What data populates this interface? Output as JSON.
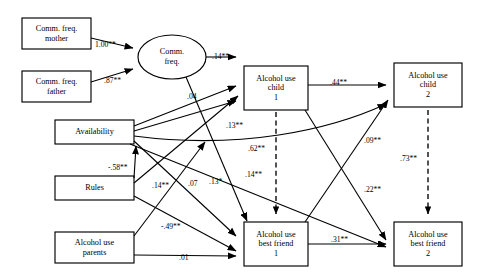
{
  "diagram": {
    "type": "structural-equation-model-path-diagram",
    "observed_variables": [
      {
        "id": "comm_mother",
        "label": "Comm. freq.\nmother",
        "x": 22,
        "y": 18,
        "w": 69,
        "h": 31
      },
      {
        "id": "comm_father",
        "label": "Comm. freq.\nfather",
        "x": 22,
        "y": 71,
        "w": 69,
        "h": 31
      },
      {
        "id": "availability",
        "label": "Availability",
        "x": 55,
        "y": 120,
        "w": 79,
        "h": 24
      },
      {
        "id": "rules",
        "label": "Rules",
        "x": 55,
        "y": 176,
        "w": 79,
        "h": 24
      },
      {
        "id": "alcohol_parents",
        "label": "Alcohol use\nparents",
        "x": 55,
        "y": 232,
        "w": 79,
        "h": 31
      },
      {
        "id": "alc_child_1",
        "label": "Alcohol use\nchild\n1",
        "x": 244,
        "y": 66,
        "w": 64,
        "h": 44
      },
      {
        "id": "alc_child_2",
        "label": "Alcohol use\nchild\n2",
        "x": 394,
        "y": 63,
        "w": 68,
        "h": 44
      },
      {
        "id": "alc_friend_1",
        "label": "Alcohol use\nbest friend\n1",
        "x": 244,
        "y": 222,
        "w": 64,
        "h": 44
      },
      {
        "id": "alc_friend_2",
        "label": "Alcohol use\nbest friend\n2",
        "x": 394,
        "y": 222,
        "w": 68,
        "h": 44
      }
    ],
    "latent_variables": [
      {
        "id": "comm_freq",
        "label": "Comm.\nfreq.",
        "cx": 172,
        "cy": 57,
        "rx": 34,
        "ry": 22
      }
    ],
    "paths": [
      {
        "id": "p1",
        "from": "comm_mother",
        "to": "comm_freq",
        "coefficient": "1.00**",
        "style": "solid"
      },
      {
        "id": "p2",
        "from": "comm_father",
        "to": "comm_freq",
        "coefficient": ".87**",
        "style": "solid"
      },
      {
        "id": "p3",
        "from": "comm_freq",
        "to": "alc_child_1",
        "coefficient": ".14**",
        "style": "solid"
      },
      {
        "id": "p4",
        "from": "comm_freq",
        "to": "alc_friend_1",
        "coefficient": "",
        "style": "solid"
      },
      {
        "id": "p5",
        "from": "availability",
        "to": "alc_child_1",
        "coefficient": ".04",
        "style": "solid"
      },
      {
        "id": "p6",
        "from": "availability",
        "to": "alc_child_1",
        "coefficient": ".13**",
        "style": "solid"
      },
      {
        "id": "p7",
        "from": "availability",
        "to": "alc_friend_1",
        "coefficient": ".14**",
        "style": "solid"
      },
      {
        "id": "p8",
        "from": "availability",
        "to": "alc_friend_2",
        "coefficient": ".22**",
        "style": "solid"
      },
      {
        "id": "p9",
        "from": "availability",
        "to": "alc_child_2",
        "coefficient": ".09**",
        "style": "solid"
      },
      {
        "id": "p10",
        "from": "rules",
        "to": "availability",
        "coefficient": "-.58**",
        "style": "solid"
      },
      {
        "id": "p11",
        "from": "rules",
        "to": "alc_friend_1",
        "coefficient": ".07",
        "style": "solid"
      },
      {
        "id": "p12",
        "from": "rules",
        "to": "alc_child_1",
        "coefficient": ".13*",
        "style": "solid"
      },
      {
        "id": "p13",
        "from": "alcohol_parents",
        "to": "availability",
        "coefficient": "-.49**",
        "style": "solid"
      },
      {
        "id": "p14",
        "from": "alcohol_parents",
        "to": "alc_friend_1",
        "coefficient": ".01",
        "style": "solid"
      },
      {
        "id": "p15",
        "from": "alc_child_1",
        "to": "alc_child_2",
        "coefficient": ".44**",
        "style": "solid"
      },
      {
        "id": "p16",
        "from": "alc_friend_1",
        "to": "alc_friend_2",
        "coefficient": ".31**",
        "style": "solid"
      },
      {
        "id": "p17",
        "from": "alc_child_1",
        "to": "alc_friend_2",
        "coefficient": "",
        "style": "solid"
      },
      {
        "id": "p18",
        "from": "alc_friend_1",
        "to": "alc_child_2",
        "coefficient": "",
        "style": "solid"
      },
      {
        "id": "p19",
        "from": "alc_child_1",
        "to": "alc_friend_1",
        "coefficient": ".62**",
        "style": "dashed"
      },
      {
        "id": "p20",
        "from": "alc_child_2",
        "to": "alc_friend_2",
        "coefficient": ".73**",
        "style": "dashed"
      }
    ],
    "coefficient_labels": [
      {
        "id": "c_100",
        "text": "1.00**",
        "x": 95,
        "y": 40
      },
      {
        "id": "c_087",
        "text": ".87**",
        "x": 104,
        "y": 76
      },
      {
        "id": "c_014",
        "text": ".14**",
        "x": 212,
        "y": 57
      },
      {
        "id": "c_004",
        "text": ".04",
        "x": 187,
        "y": 96
      },
      {
        "id": "c_013a",
        "text": ".13**",
        "x": 226,
        "y": 125
      },
      {
        "id": "c_062",
        "text": ".62**",
        "x": 268,
        "y": 148
      },
      {
        "id": "c_014b",
        "text": ".14**",
        "x": 265,
        "y": 174
      },
      {
        "id": "c_058",
        "text": "-.58**",
        "x": 110,
        "y": 167
      },
      {
        "id": "c_014c",
        "text": ".14**",
        "x": 155,
        "y": 185
      },
      {
        "id": "c_007",
        "text": ".07",
        "x": 189,
        "y": 184
      },
      {
        "id": "c_013b",
        "text": ".13*",
        "x": 212,
        "y": 180
      },
      {
        "id": "c_049",
        "text": "-.49**",
        "x": 164,
        "y": 226
      },
      {
        "id": "c_001",
        "text": ".01",
        "x": 181,
        "y": 258
      },
      {
        "id": "c_044",
        "text": ".44**",
        "x": 341,
        "y": 82
      },
      {
        "id": "c_009",
        "text": ".09**",
        "x": 372,
        "y": 140
      },
      {
        "id": "c_073",
        "text": ".73**",
        "x": 414,
        "y": 158
      },
      {
        "id": "c_022",
        "text": ".22**",
        "x": 371,
        "y": 189
      },
      {
        "id": "c_031",
        "text": ".31**",
        "x": 340,
        "y": 239
      }
    ]
  }
}
